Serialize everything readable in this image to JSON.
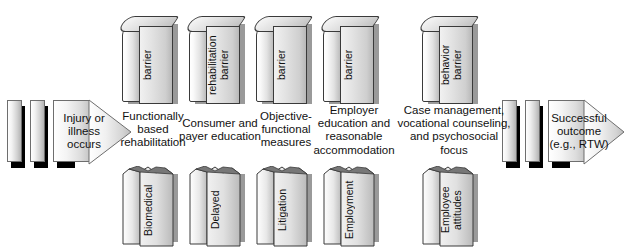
{
  "figure": {
    "type": "process-flow-diagram",
    "orientation": "left-to-right"
  },
  "flow": {
    "start_arrow": {
      "label": "Injury or\nillness\noccurs",
      "name": "start-arrow"
    },
    "end_arrow": {
      "label": "Successful\noutcome\n(e.g., RTW)",
      "name": "end-arrow"
    }
  },
  "steps": [
    {
      "caption": "Functionally\nbased\nrehabilitation",
      "intact_barrier": "barrier",
      "broken_barrier": "Biomedical"
    },
    {
      "caption": "Consumer and\npayer education",
      "intact_barrier": "rehabilitation\nbarrier",
      "broken_barrier": "Delayed"
    },
    {
      "caption": "Objective-\nfunctional\nmeasures",
      "intact_barrier": "barrier",
      "broken_barrier": "Litigation"
    },
    {
      "caption": "Employer\neducation and\nreasonable\naccommodation",
      "intact_barrier": "barrier",
      "broken_barrier": "Employment"
    },
    {
      "caption": "Case management,\nvocational counseling,\nand psychosocial\nfocus",
      "intact_barrier": "behavior\nbarrier",
      "broken_barrier": "Employee\nattitudes"
    }
  ],
  "colors": {
    "background": "#ffffff",
    "text": "#111111",
    "block_outline": "#3a3a3a",
    "block_face_light": "#f6f6f6",
    "block_face_dark": "#bdbdbd",
    "shadow": "#000000"
  }
}
